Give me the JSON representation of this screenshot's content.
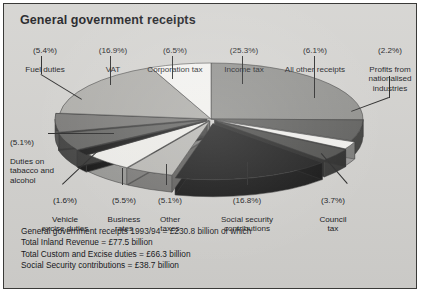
{
  "title": "General government receipts",
  "colors": {
    "card_background": "#d3d2cf",
    "border": "#3a3a38",
    "text": "#15161a",
    "leader_line": "#242424"
  },
  "labels": {
    "fuel_duties": {
      "pct": "(5.4%)",
      "name": "Fuel duties"
    },
    "vat": {
      "pct": "(16.9%)",
      "name": "VAT"
    },
    "corporation_tax": {
      "pct": "(6.5%)",
      "name": "Corporation tax"
    },
    "income_tax": {
      "pct": "(25.3%)",
      "name": "Income tax"
    },
    "all_other_receipts": {
      "pct": "(6.1%)",
      "name": "All other receipts"
    },
    "profits": {
      "pct": "(2.2%)",
      "name": "Profits from\nnationalised\nindustries"
    },
    "duties_tobacco": {
      "pct": "(5.1%)",
      "name": "Duties on\ntabacco and\nalcohol"
    },
    "vehicle_excise": {
      "pct": "(1.6%)",
      "name": "Vehicle\nexcise duties"
    },
    "business_rates": {
      "pct": "(5.5%)",
      "name": "Business\nrates"
    },
    "other_taxes": {
      "pct": "(5.1%)",
      "name": "Other\ntaxes"
    },
    "social_security": {
      "pct": "(16.8%)",
      "name": "Social security\ncontributions"
    },
    "council_tax": {
      "pct": "(3.7%)",
      "name": "Council\ntax"
    }
  },
  "footer": {
    "line1": "General government receipts 1993/94 = £230.8 billion of which",
    "line2": "Total Inland Revenue = £77.5 billion",
    "line3": "Total Custom and Excise duties = £66.3 billion",
    "line4": "Social Security contributions = £38.7 billion"
  },
  "chart_data": {
    "type": "pie",
    "title": "General government receipts",
    "subtitle": "UK 1993/94",
    "value_unit": "percent",
    "total": "£230.8 billion",
    "exploded": true,
    "three_d": true,
    "legend": "callout-labels",
    "categories": [
      "Income tax",
      "All other receipts",
      "Profits from nationalised industries",
      "Council tax",
      "Social security contributions",
      "Other taxes",
      "Business rates",
      "Vehicle excise duties",
      "Duties on tabacco and alcohol",
      "Fuel duties",
      "VAT",
      "Corporation tax"
    ],
    "values": [
      25.3,
      6.1,
      2.2,
      3.7,
      16.8,
      5.1,
      5.5,
      1.6,
      5.1,
      5.4,
      16.9,
      6.5
    ],
    "slice_colors": [
      "#8f8f8c",
      "#5d5d5b",
      "#f2f1ee",
      "#4c4c4a",
      "#1b1b1b",
      "#b9b8b4",
      "#efeeea",
      "#161616",
      "#636361",
      "#787775",
      "#adaca8",
      "#f4f3f0"
    ],
    "annotations": [
      "General government receipts 1993/94 = £230.8 billion of which",
      "Total Inland Revenue = £77.5 billion",
      "Total Custom and Excise duties = £66.3 billion",
      "Social Security contributions = £38.7 billion"
    ]
  }
}
